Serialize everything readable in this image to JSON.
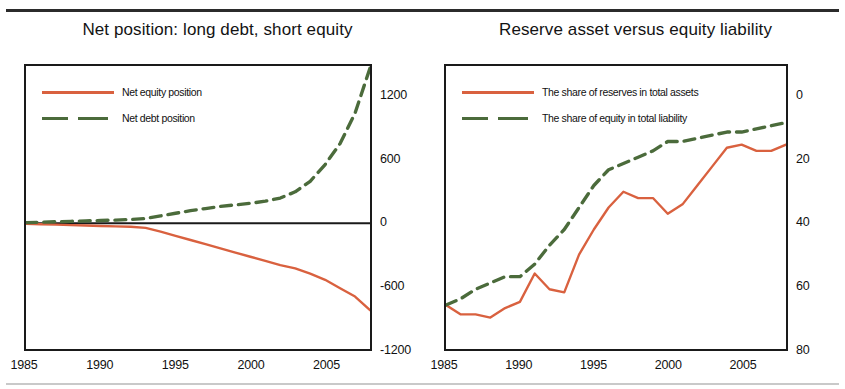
{
  "figure": {
    "panels": [
      {
        "title": "Net position: long debt, short equity",
        "legend": [
          {
            "label": "Net equity position",
            "style": "solid",
            "color": "#d9613f"
          },
          {
            "label": "Net debt position",
            "style": "dashed",
            "color": "#4b6b3b"
          }
        ],
        "yticks": [
          "1200",
          "600",
          "0",
          "-600",
          "-1200"
        ],
        "xticks": [
          "1985",
          "1990",
          "1995",
          "2000",
          "2005"
        ]
      },
      {
        "title": "Reserve asset versus equity liability",
        "legend": [
          {
            "label": "The share of reserves in total assets",
            "style": "solid",
            "color": "#d9613f"
          },
          {
            "label": "The share of equity in total liability",
            "style": "dashed",
            "color": "#4b6b3b"
          }
        ],
        "yticks": [
          "80",
          "60",
          "40",
          "20",
          "0"
        ],
        "xticks": [
          "1985",
          "1990",
          "1995",
          "2000",
          "2005"
        ]
      }
    ]
  },
  "chart_data": [
    {
      "type": "line",
      "title": "Net position: long debt, short equity",
      "xlabel": "",
      "ylabel": "",
      "xlim": [
        1985,
        2008
      ],
      "ylim": [
        -1200,
        1500
      ],
      "yticks": [
        1200,
        600,
        0,
        -600,
        -1200
      ],
      "xticks": [
        1985,
        1990,
        1995,
        2000,
        2005
      ],
      "grid": false,
      "legend_position": "top-left",
      "x": [
        1985,
        1986,
        1987,
        1988,
        1989,
        1990,
        1991,
        1992,
        1993,
        1994,
        1995,
        1996,
        1997,
        1998,
        1999,
        2000,
        2001,
        2002,
        2003,
        2004,
        2005,
        2006,
        2007,
        2008
      ],
      "series": [
        {
          "name": "Net equity position",
          "color": "#d9613f",
          "style": "solid",
          "values": [
            -5,
            -10,
            -14,
            -18,
            -22,
            -26,
            -30,
            -34,
            -45,
            -80,
            -120,
            -160,
            -200,
            -240,
            -280,
            -320,
            -360,
            -400,
            -430,
            -480,
            -540,
            -620,
            -700,
            -830
          ]
        },
        {
          "name": "Net debt position",
          "color": "#4b6b3b",
          "style": "dashed",
          "values": [
            5,
            10,
            14,
            18,
            22,
            26,
            30,
            36,
            45,
            70,
            95,
            120,
            140,
            160,
            175,
            190,
            210,
            240,
            300,
            400,
            560,
            760,
            1050,
            1480
          ]
        }
      ]
    },
    {
      "type": "line",
      "title": "Reserve asset versus equity liability",
      "xlabel": "",
      "ylabel": "",
      "xlim": [
        1985,
        2008
      ],
      "ylim": [
        0,
        90
      ],
      "yticks": [
        0,
        20,
        40,
        60,
        80
      ],
      "xticks": [
        1985,
        1990,
        1995,
        2000,
        2005
      ],
      "grid": false,
      "legend_position": "top-left",
      "x": [
        1985,
        1986,
        1987,
        1988,
        1989,
        1990,
        1991,
        1992,
        1993,
        1994,
        1995,
        1996,
        1997,
        1998,
        1999,
        2000,
        2001,
        2002,
        2003,
        2004,
        2005,
        2006,
        2007,
        2008
      ],
      "series": [
        {
          "name": "The share of reserves in total assets",
          "color": "#d9613f",
          "style": "solid",
          "values": [
            14,
            11,
            11,
            10,
            13,
            15,
            24,
            19,
            18,
            30,
            38,
            45,
            50,
            48,
            48,
            43,
            46,
            52,
            58,
            64,
            65,
            63,
            63,
            65
          ]
        },
        {
          "name": "The share of equity in total liability",
          "color": "#4b6b3b",
          "style": "dashed",
          "values": [
            14,
            16,
            19,
            21,
            23,
            23,
            27,
            33,
            38,
            45,
            52,
            57,
            59,
            61,
            63,
            66,
            66,
            67,
            68,
            69,
            69,
            70,
            71,
            72
          ]
        }
      ]
    }
  ]
}
